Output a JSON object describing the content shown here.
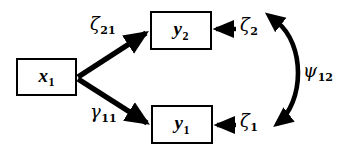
{
  "diagram": {
    "type": "sem-path-diagram",
    "background_color": "#ffffff",
    "stroke_color": "#000000",
    "canvas": {
      "width": 346,
      "height": 149
    },
    "nodes": [
      {
        "id": "x1",
        "symbol": "x",
        "subscript": "1",
        "shape": "rectangle",
        "role": "exogenous-observed-variable",
        "x": 16,
        "y": 58,
        "width": 61,
        "height": 38
      },
      {
        "id": "y2",
        "symbol": "y",
        "subscript": "2",
        "shape": "rectangle",
        "role": "endogenous-observed-variable",
        "x": 150,
        "y": 11,
        "width": 62,
        "height": 39
      },
      {
        "id": "y1",
        "symbol": "y",
        "subscript": "1",
        "shape": "rectangle",
        "role": "endogenous-observed-variable",
        "x": 151,
        "y": 105,
        "width": 62,
        "height": 39
      }
    ],
    "parameters": [
      {
        "id": "zeta21",
        "greek": "ζ",
        "greek_name": "zeta",
        "subscript": "21",
        "path": "x1 -> y2",
        "arrow": "single-headed",
        "x": 90,
        "y": 15
      },
      {
        "id": "gamma11",
        "greek": "γ",
        "greek_name": "gamma",
        "subscript": "11",
        "path": "x1 -> y1",
        "arrow": "single-headed",
        "x": 90,
        "y": 103
      },
      {
        "id": "zeta2",
        "greek": "ζ",
        "greek_name": "zeta",
        "subscript": "2",
        "path": "disturbance -> y2",
        "arrow": "single-headed",
        "x": 240,
        "y": 16
      },
      {
        "id": "zeta1",
        "greek": "ζ",
        "greek_name": "zeta",
        "subscript": "1",
        "path": "disturbance -> y1",
        "arrow": "single-headed",
        "x": 240,
        "y": 112
      },
      {
        "id": "psi12",
        "greek": "ψ",
        "greek_name": "psi",
        "subscript": "12",
        "path": "zeta2 <-> zeta1",
        "arrow": "double-headed-curved",
        "x": 303,
        "y": 62
      }
    ]
  }
}
